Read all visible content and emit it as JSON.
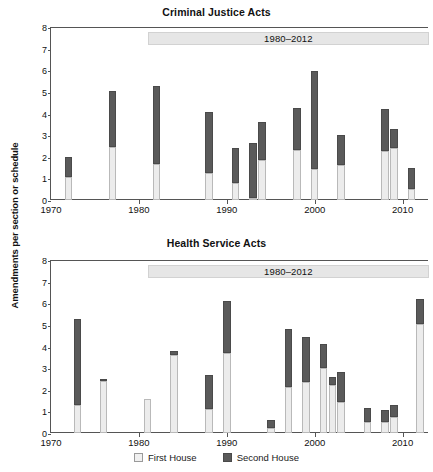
{
  "axis": {
    "ylabel": "Amendments per section or schedule",
    "yticks": [
      0,
      1,
      2,
      3,
      4,
      5,
      6,
      7,
      8
    ],
    "xticks": [
      1970,
      1980,
      1990,
      2000,
      2010
    ],
    "ylim": [
      0,
      8
    ],
    "xlim": [
      1970,
      2013
    ]
  },
  "legend": {
    "position": "bottom-center",
    "items": [
      {
        "label": "First House",
        "color": "#f0f0f0",
        "key": "first"
      },
      {
        "label": "Second House",
        "color": "#5a5a5a",
        "key": "second"
      }
    ]
  },
  "annotation": {
    "band_label": "1980–2012",
    "band_start_year": 1981,
    "band_end_year": 2013,
    "band_color": "#e6e6e6"
  },
  "chart_data": [
    {
      "type": "bar",
      "stacked": true,
      "title": "Criminal Justice Acts",
      "xlabel": "",
      "ylabel": "Amendments per section or schedule",
      "ylim": [
        0,
        8
      ],
      "xlim": [
        1970,
        2013
      ],
      "grid": false,
      "legend": [
        "First House",
        "Second House"
      ],
      "x": [
        1972,
        1977,
        1982,
        1988,
        1991,
        1993,
        1994,
        1998,
        2000,
        2003,
        2008,
        2009,
        2011
      ],
      "series": [
        {
          "name": "First House",
          "values": [
            1.05,
            2.45,
            1.65,
            1.25,
            0.8,
            0.1,
            1.85,
            2.3,
            1.45,
            1.6,
            2.25,
            2.4,
            0.5
          ]
        },
        {
          "name": "Second House",
          "values": [
            0.95,
            2.6,
            3.6,
            2.8,
            1.6,
            2.55,
            1.75,
            1.95,
            4.5,
            1.4,
            1.95,
            0.9,
            1.0
          ]
        }
      ],
      "totals": [
        2.0,
        5.05,
        5.25,
        4.05,
        2.4,
        2.65,
        3.6,
        4.25,
        5.95,
        3.0,
        4.2,
        3.3,
        1.5
      ]
    },
    {
      "type": "bar",
      "stacked": true,
      "title": "Health Service Acts",
      "xlabel": "",
      "ylabel": "Amendments per section or schedule",
      "ylim": [
        0,
        8
      ],
      "xlim": [
        1970,
        2013
      ],
      "grid": false,
      "legend": [
        "First House",
        "Second House"
      ],
      "x": [
        1973,
        1976,
        1981,
        1984,
        1988,
        1990,
        1995,
        1997,
        1999,
        2001,
        2002,
        2003,
        2006,
        2008,
        2009,
        2012
      ],
      "series": [
        {
          "name": "First House",
          "values": [
            1.3,
            2.4,
            1.55,
            3.6,
            1.1,
            3.7,
            0.25,
            2.15,
            2.35,
            3.0,
            2.2,
            1.45,
            0.5,
            0.5,
            0.75,
            5.05
          ]
        },
        {
          "name": "Second House",
          "values": [
            3.95,
            0.1,
            0.0,
            0.2,
            1.6,
            2.4,
            0.35,
            2.65,
            2.1,
            1.1,
            0.4,
            1.35,
            0.65,
            0.55,
            0.55,
            1.15
          ]
        }
      ],
      "totals": [
        5.25,
        2.5,
        1.55,
        3.8,
        2.7,
        6.1,
        0.6,
        4.8,
        4.45,
        4.1,
        2.6,
        2.8,
        1.15,
        1.05,
        1.3,
        6.2
      ]
    }
  ]
}
